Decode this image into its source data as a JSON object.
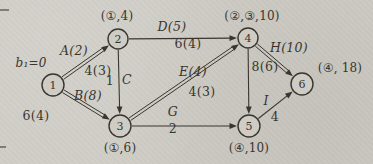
{
  "figure": {
    "paper_color": "#ceccc5",
    "ink_color": "#38362f",
    "nodes": [
      {
        "id": "n1",
        "label": "1",
        "x": 53,
        "y": 85,
        "r": 11
      },
      {
        "id": "n2",
        "label": "2",
        "x": 118,
        "y": 39,
        "r": 10
      },
      {
        "id": "n3",
        "label": "3",
        "x": 120,
        "y": 126,
        "r": 11
      },
      {
        "id": "n4",
        "label": "4",
        "x": 248,
        "y": 38,
        "r": 10
      },
      {
        "id": "n5",
        "label": "5",
        "x": 249,
        "y": 126,
        "r": 11
      },
      {
        "id": "n6",
        "label": "6",
        "x": 302,
        "y": 84,
        "r": 11
      }
    ],
    "annotations": [
      {
        "id": "annotation-b1",
        "text": "b₁=0",
        "x": 31,
        "y": 63,
        "italic": true
      },
      {
        "id": "annotation-node-2",
        "text": "(①,4)",
        "x": 117,
        "y": 16,
        "italic": false
      },
      {
        "id": "annotation-node-4",
        "text": "(②,③,10)",
        "x": 252,
        "y": 16,
        "italic": false
      },
      {
        "id": "annotation-node-3",
        "text": "(①,6)",
        "x": 120,
        "y": 148,
        "italic": false
      },
      {
        "id": "annotation-node-5",
        "text": "(④,10)",
        "x": 249,
        "y": 148,
        "italic": false
      },
      {
        "id": "annotation-node-6",
        "text": "(④, 18)",
        "x": 340,
        "y": 68,
        "italic": false
      }
    ],
    "edges": [
      {
        "id": "edge-1-2",
        "from": "n1",
        "to": "n2",
        "double": true,
        "labels": [
          {
            "id": "label-A",
            "text": "A(2)",
            "x": 74,
            "y": 51,
            "italic": true
          },
          {
            "id": "label-1-2-cost",
            "text": "4(3)",
            "x": 98,
            "y": 71,
            "italic": false
          }
        ]
      },
      {
        "id": "edge-1-3",
        "from": "n1",
        "to": "n3",
        "double": true,
        "labels": [
          {
            "id": "label-B",
            "text": "B(8)",
            "x": 88,
            "y": 96,
            "italic": true
          },
          {
            "id": "label-1-3-cost",
            "text": "6(4)",
            "x": 36,
            "y": 116,
            "italic": false
          }
        ]
      },
      {
        "id": "edge-2-4",
        "from": "n2",
        "to": "n4",
        "double": false,
        "labels": [
          {
            "id": "label-D",
            "text": "D(5)",
            "x": 172,
            "y": 27,
            "italic": true
          },
          {
            "id": "label-2-4-cost",
            "text": "6(4)",
            "x": 188,
            "y": 44,
            "italic": false
          }
        ]
      },
      {
        "id": "edge-2-3",
        "from": "n2",
        "to": "n3",
        "double": false,
        "labels": [
          {
            "id": "label-2-3-flow",
            "text": "1",
            "x": 110,
            "y": 81,
            "italic": false
          },
          {
            "id": "label-C",
            "text": "C",
            "x": 127,
            "y": 80,
            "italic": true
          }
        ]
      },
      {
        "id": "edge-3-4",
        "from": "n3",
        "to": "n4",
        "double": true,
        "labels": [
          {
            "id": "label-E",
            "text": "E(4)",
            "x": 193,
            "y": 72,
            "italic": true
          },
          {
            "id": "label-3-4-cost",
            "text": "4(3)",
            "x": 202,
            "y": 92,
            "italic": false
          }
        ]
      },
      {
        "id": "edge-3-5",
        "from": "n3",
        "to": "n5",
        "double": false,
        "labels": [
          {
            "id": "label-G",
            "text": "G",
            "x": 173,
            "y": 112,
            "italic": true
          },
          {
            "id": "label-3-5-cost",
            "text": "2",
            "x": 173,
            "y": 129,
            "italic": false
          }
        ]
      },
      {
        "id": "edge-4-5",
        "from": "n4",
        "to": "n5",
        "double": false,
        "labels": [
          {
            "id": "label-4-5-cost",
            "text": "8(6)",
            "x": 265,
            "y": 67,
            "italic": false
          }
        ]
      },
      {
        "id": "edge-4-6",
        "from": "n4",
        "to": "n6",
        "double": true,
        "labels": [
          {
            "id": "label-H",
            "text": "H(10)",
            "x": 289,
            "y": 48,
            "italic": true
          }
        ]
      },
      {
        "id": "edge-5-6",
        "from": "n5",
        "to": "n6",
        "double": false,
        "labels": [
          {
            "id": "label-I",
            "text": "I",
            "x": 266,
            "y": 101,
            "italic": true
          },
          {
            "id": "label-5-6-cost",
            "text": "4",
            "x": 275,
            "y": 117,
            "italic": false
          }
        ]
      }
    ],
    "page_marks": [
      {
        "x": 0,
        "y": 9,
        "w": 9,
        "h": 2
      },
      {
        "x": 0,
        "y": 146,
        "w": 6,
        "h": 2
      }
    ]
  }
}
